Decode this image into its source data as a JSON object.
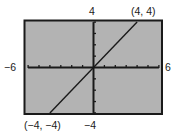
{
  "chart_data": {
    "type": "line",
    "title": "",
    "xlabel": "",
    "ylabel": "",
    "xlim": [
      -6,
      6
    ],
    "ylim": [
      -4,
      4
    ],
    "x_tick_step": 1,
    "y_tick_step": 1,
    "grid": false,
    "legend": null,
    "series": [
      {
        "name": "y = x",
        "x": [
          -4,
          4
        ],
        "y": [
          -4,
          4
        ],
        "color": "#1a1a1a"
      }
    ],
    "axis_labels": {
      "x_min": "−6",
      "x_max": "6",
      "y_max": "4",
      "y_min": "−4"
    },
    "annotations": [
      {
        "text": "(4, 4)",
        "x": 4,
        "y": 4,
        "position": "above-right"
      },
      {
        "text": "(−4, −4)",
        "x": -4,
        "y": -4,
        "position": "below-left"
      }
    ],
    "colors": {
      "plot_background": "#b3b3b3",
      "frame": "#1a1a1a",
      "axes": "#1a1a1a",
      "page_background": "#ffffff"
    }
  }
}
